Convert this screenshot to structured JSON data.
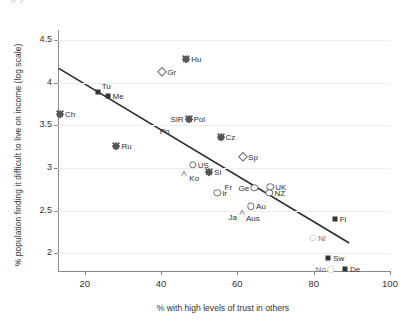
{
  "title_remnant": "g                                 y",
  "axes": {
    "xlabel": "% with high levels of trust in others",
    "ylabel": "% population finding it difficult to live on income (log scale)",
    "xticks": [
      20,
      40,
      60,
      80,
      100
    ],
    "yticks": [
      4.5,
      4,
      3.5,
      3,
      2.5,
      2
    ]
  },
  "chart_data": {
    "type": "scatter",
    "title": "",
    "xlabel": "% with high levels of trust in others",
    "ylabel": "% population finding it difficult to live on income (log scale)",
    "xlim": [
      13,
      100
    ],
    "ylim": [
      1.78,
      4.62
    ],
    "grid": true,
    "legend": "none",
    "trendline": {
      "x1": 13.2,
      "y1": 4.17,
      "x2": 89.3,
      "y2": 2.12
    },
    "points": [
      {
        "label": "Ch",
        "x": 13.5,
        "y": 3.64,
        "marker": "diamond-filled",
        "label_pos": "r"
      },
      {
        "label": "Tu",
        "x": 23.4,
        "y": 3.89,
        "marker": "square-filled",
        "label_pos": "tr"
      },
      {
        "label": "Me",
        "x": 26.0,
        "y": 3.85,
        "marker": "square-filled",
        "label_pos": "r"
      },
      {
        "label": "Ru",
        "x": 28.3,
        "y": 3.26,
        "marker": "diamond-filled",
        "label_pos": "r"
      },
      {
        "label": "Po",
        "x": 38.6,
        "y": 3.5,
        "marker": "none",
        "label_pos": "br"
      },
      {
        "label": "Gr",
        "x": 40.3,
        "y": 4.13,
        "marker": "diamond-open",
        "label_pos": "r"
      },
      {
        "label": "Hu",
        "x": 46.6,
        "y": 4.28,
        "marker": "diamond-filled",
        "label_pos": "r"
      },
      {
        "label": "SlR",
        "x": 47.2,
        "y": 3.57,
        "marker": "none",
        "label_pos": "l"
      },
      {
        "label": "Pol",
        "x": 47.2,
        "y": 3.57,
        "marker": "diamond-filled",
        "label_pos": "r"
      },
      {
        "label": "US",
        "x": 48.3,
        "y": 3.04,
        "marker": "circle-open",
        "label_pos": "r"
      },
      {
        "label": "Ko",
        "x": 46.1,
        "y": 2.94,
        "marker": "triangle-open",
        "label_pos": "r"
      },
      {
        "label": "Sl",
        "x": 52.6,
        "y": 2.95,
        "marker": "diamond-filled",
        "label_pos": "r"
      },
      {
        "label": "Fr",
        "x": 55.6,
        "y": 2.85,
        "marker": "none",
        "label_pos": "br"
      },
      {
        "label": "Cz",
        "x": 55.6,
        "y": 3.37,
        "marker": "diamond-filled",
        "label_pos": "r"
      },
      {
        "label": "Ir",
        "x": 54.7,
        "y": 2.71,
        "marker": "circle-open",
        "label_pos": "r"
      },
      {
        "label": "Ge",
        "x": 64.4,
        "y": 2.77,
        "marker": "circle-open",
        "label_pos": "l"
      },
      {
        "label": "Sp",
        "x": 61.5,
        "y": 3.13,
        "marker": "diamond-open",
        "label_pos": "r"
      },
      {
        "label": "Ja",
        "x": 61.2,
        "y": 2.48,
        "marker": "triangle-open",
        "label_pos": "l"
      },
      {
        "label": "Aus",
        "x": 61.2,
        "y": 2.48,
        "marker": "none",
        "label_pos": "br"
      },
      {
        "label": "Au",
        "x": 63.6,
        "y": 2.55,
        "marker": "circle-open",
        "label_pos": "r"
      },
      {
        "label": "UK",
        "x": 68.6,
        "y": 2.78,
        "marker": "circle-open",
        "label_pos": "r"
      },
      {
        "label": "NZ",
        "x": 68.4,
        "y": 2.71,
        "marker": "circle-open",
        "label_pos": "r"
      },
      {
        "label": "Fi",
        "x": 85.5,
        "y": 2.4,
        "marker": "square-filled",
        "label_pos": "r"
      },
      {
        "label": "Nl",
        "x": 79.8,
        "y": 2.18,
        "marker": "circle-faint",
        "label_pos": "r"
      },
      {
        "label": "Sw",
        "x": 83.8,
        "y": 1.95,
        "marker": "square-filled",
        "label_pos": "r"
      },
      {
        "label": "No",
        "x": 84.5,
        "y": 1.81,
        "marker": "circle-faint",
        "label_pos": "l"
      },
      {
        "label": "De",
        "x": 88.2,
        "y": 1.81,
        "marker": "square-filled",
        "label_pos": "r"
      }
    ]
  }
}
